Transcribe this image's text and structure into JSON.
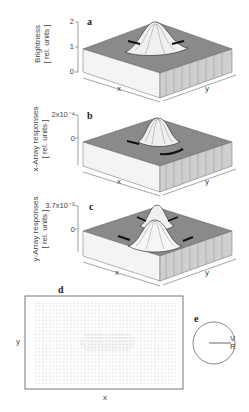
{
  "figure": {
    "panels": [
      {
        "letter": "a",
        "ylabel_line1": "Brightness",
        "ylabel_line2": "[ rel. units ]",
        "ticks": [
          "2",
          "1",
          "0"
        ],
        "xlabel": "x",
        "ylabel_axis": "y"
      },
      {
        "letter": "b",
        "ylabel_line1": "x-Array responses",
        "ylabel_line2": "[ rel. units ]",
        "ticks": [
          "2x10⁻⁴",
          "0"
        ],
        "xlabel": "x",
        "ylabel_axis": "y"
      },
      {
        "letter": "c",
        "ylabel_line1": "y-Array responses",
        "ylabel_line2": "[ rel. units ]",
        "ticks": [
          "3.7x10⁻⁵",
          "0"
        ],
        "xlabel": "x",
        "ylabel_axis": "y"
      },
      {
        "letter": "d",
        "xlabel": "x",
        "ylabel": "y"
      },
      {
        "letter": "e",
        "label_v": "V",
        "label_r": "R"
      }
    ]
  }
}
